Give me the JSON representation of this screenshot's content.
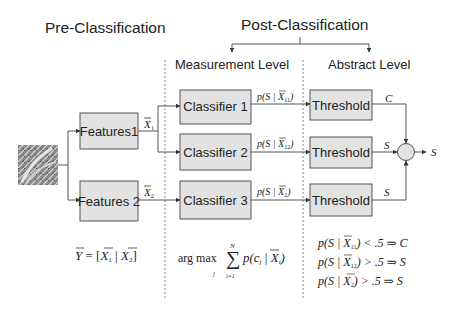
{
  "headers": {
    "pre_classification": "Pre-Classification",
    "post_classification": "Post-Classification",
    "measurement_level": "Measurement Level",
    "abstract_level": "Abstract Level"
  },
  "input_image": {
    "label": "texture-image"
  },
  "features": [
    {
      "label": "Features1",
      "output": "X",
      "output_sub": "1"
    },
    {
      "label": "Features 2",
      "output": "X",
      "output_sub": "2"
    }
  ],
  "classifiers": [
    {
      "label": "Classifier 1",
      "output_prefix": "p(S | ",
      "output_var": "X",
      "output_sub": "11",
      "output_suffix": ")"
    },
    {
      "label": "Classifier 2",
      "output_prefix": "p(S | ",
      "output_var": "X",
      "output_sub": "12",
      "output_suffix": ")"
    },
    {
      "label": "Classifier 3",
      "output_prefix": "p(S | ",
      "output_var": "X",
      "output_sub": "2",
      "output_suffix": ")"
    }
  ],
  "thresholds": [
    {
      "label": "Threshold",
      "output": "C"
    },
    {
      "label": "Threshold",
      "output": "S"
    },
    {
      "label": "Threshold",
      "output": "S"
    }
  ],
  "fusion": {
    "output": "S"
  },
  "formulas": {
    "pre": {
      "lhs": "Y",
      "eq": " = [",
      "x1": "X",
      "s1": "1",
      "sep": " | ",
      "x2": "X",
      "s2": "2",
      "close": "]"
    },
    "measurement": {
      "argmax": "arg max",
      "argsub": "j",
      "sum": "∑",
      "sum_top": "N",
      "sum_bottom": "i=1",
      "body_pre": "p(c",
      "body_sub_j": "j",
      "body_mid": " | ",
      "body_var": "X",
      "body_sub_i": "i",
      "body_close": ")"
    },
    "abstract": [
      {
        "prefix": "p(S | ",
        "var": "X",
        "sub": "11",
        "suffix": ") < .5 ⇒ C"
      },
      {
        "prefix": "p(S | ",
        "var": "X",
        "sub": "12",
        "suffix": ") > .5 ⇒ S"
      },
      {
        "prefix": "p(S  | ",
        "var": "X",
        "sub": "2",
        "suffix": ") > .5 ⇒ S"
      }
    ]
  }
}
